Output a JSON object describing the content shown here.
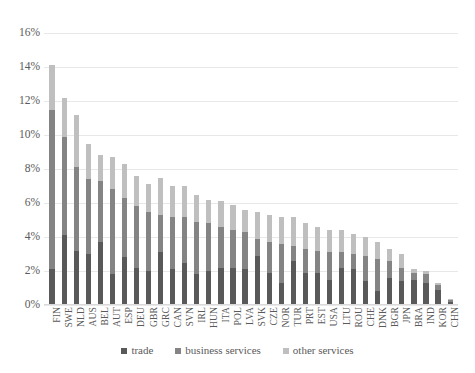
{
  "chart_data": {
    "type": "bar",
    "subtype": "stacked-column",
    "title": "",
    "subtitle": "",
    "xlabel": "",
    "ylabel": "",
    "ylim": [
      0,
      16
    ],
    "ytick_values": [
      0,
      2,
      4,
      6,
      8,
      10,
      12,
      14,
      16
    ],
    "ytick_labels": [
      "0%",
      "2%",
      "4%",
      "6%",
      "8%",
      "10%",
      "12%",
      "14%",
      "16%"
    ],
    "grid": true,
    "grid_axis": "y",
    "legend_position": "bottom",
    "legend": [
      "trade",
      "business services",
      "other services"
    ],
    "categories": [
      "FIN",
      "SWE",
      "NLD",
      "AUS",
      "BEL",
      "AUT",
      "ESP",
      "DEU",
      "GBR",
      "GRC",
      "CAN",
      "SVN",
      "IRL",
      "HUN",
      "ITA",
      "POL",
      "LVA",
      "SVK",
      "CZE",
      "NOR",
      "TUR",
      "PRT",
      "EST",
      "USA",
      "LTU",
      "ROU",
      "CHE",
      "DNK",
      "BGR",
      "JPN",
      "BRA",
      "IND",
      "KOR",
      "CHN"
    ],
    "series": [
      {
        "name": "trade",
        "color": "#595959",
        "values": [
          2.1,
          4.1,
          3.2,
          3.0,
          3.7,
          1.8,
          2.8,
          2.2,
          2.0,
          3.1,
          2.1,
          2.5,
          1.8,
          2.0,
          2.2,
          2.2,
          2.1,
          2.9,
          1.9,
          1.3,
          2.6,
          1.9,
          1.9,
          1.5,
          2.2,
          2.1,
          1.4,
          0.8,
          1.6,
          1.4,
          1.5,
          1.3,
          0.9,
          0.2
        ]
      },
      {
        "name": "business services",
        "color": "#848484",
        "values": [
          9.4,
          5.8,
          4.9,
          4.4,
          3.6,
          5.0,
          3.5,
          3.6,
          3.5,
          2.2,
          3.1,
          2.7,
          3.1,
          2.8,
          2.4,
          2.2,
          2.2,
          1.0,
          1.8,
          2.3,
          0.9,
          1.4,
          1.3,
          1.6,
          0.9,
          0.9,
          1.5,
          1.9,
          1.0,
          0.8,
          0.4,
          0.5,
          0.3,
          0.1
        ]
      },
      {
        "name": "other services",
        "color": "#bfbfbf",
        "values": [
          2.6,
          2.3,
          3.1,
          2.1,
          1.5,
          1.9,
          2.0,
          1.8,
          1.6,
          2.2,
          1.8,
          1.8,
          1.6,
          1.4,
          1.5,
          1.5,
          1.3,
          1.6,
          1.6,
          1.6,
          1.7,
          1.5,
          1.4,
          1.3,
          1.3,
          1.2,
          1.1,
          1.0,
          0.7,
          0.8,
          0.2,
          0.2,
          0.1,
          0.05
        ]
      }
    ],
    "totals": [
      14.1,
      12.2,
      11.2,
      9.5,
      8.8,
      8.7,
      8.3,
      7.6,
      7.1,
      7.5,
      7.0,
      7.0,
      6.5,
      6.2,
      6.1,
      5.9,
      5.6,
      5.5,
      5.3,
      5.2,
      5.2,
      4.8,
      4.6,
      4.4,
      4.4,
      4.2,
      4.0,
      3.7,
      3.3,
      3.0,
      2.1,
      2.0,
      1.3,
      0.35
    ]
  },
  "axis": {
    "y_title": "",
    "x_title": ""
  },
  "legend": {
    "items": [
      {
        "label": "trade",
        "color": "#595959"
      },
      {
        "label": "business services",
        "color": "#848484"
      },
      {
        "label": "other services",
        "color": "#bfbfbf"
      }
    ]
  }
}
